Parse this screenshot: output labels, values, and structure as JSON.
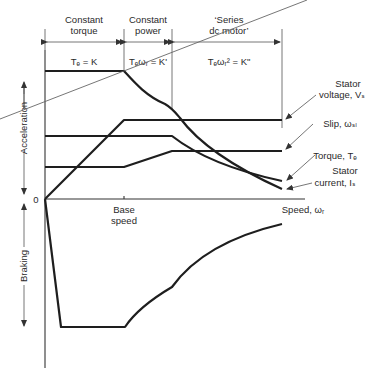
{
  "regions": [
    {
      "title_line1": "Constant",
      "title_line2": "torque",
      "equation": "Tₑ = K"
    },
    {
      "title_line1": "Constant",
      "title_line2": "power",
      "equation": "Tₑωᵣ = K'"
    },
    {
      "title_line1": "‘Series",
      "title_line2": "dc motor’",
      "equation": "Tₑωᵣ² = K\""
    }
  ],
  "axes": {
    "origin_label": "0",
    "x_label": "Speed, ωᵣ",
    "base_speed_line1": "Base",
    "base_speed_line2": "speed",
    "y_upper_label": "Acceleration",
    "y_lower_label": "Braking"
  },
  "curve_labels": {
    "stator_voltage_line1": "Stator",
    "stator_voltage_line2": "voltage, Vₛ",
    "slip": "Slip, ωₛₗ",
    "torque": "Torque, Tₑ",
    "stator_current_line1": "Stator",
    "stator_current_line2": "current, Iₛ"
  }
}
